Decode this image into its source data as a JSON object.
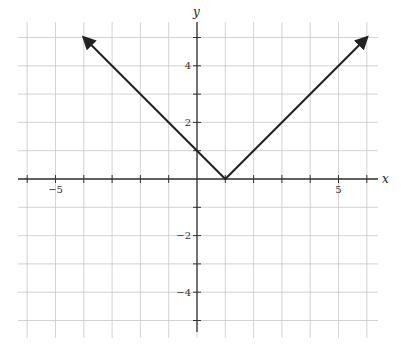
{
  "chart_data": {
    "type": "line",
    "title": "",
    "xlabel": "x",
    "ylabel": "y",
    "xlim": [
      -6.3,
      6.5
    ],
    "ylim": [
      -5.5,
      6
    ],
    "grid": true,
    "grid_step": 1,
    "x_tick_labels": [
      {
        "value": -5,
        "label": "−5"
      },
      {
        "value": 5,
        "label": "5"
      }
    ],
    "y_tick_labels": [
      {
        "value": 4,
        "label": "4"
      },
      {
        "value": 2,
        "label": "2"
      },
      {
        "value": -2,
        "label": "−2"
      },
      {
        "value": -4,
        "label": "−4"
      }
    ],
    "series": [
      {
        "name": "y = |x − 1|",
        "points": [
          [
            -4,
            5
          ],
          [
            1,
            0
          ],
          [
            6,
            5
          ]
        ],
        "arrows_at_ends": true,
        "color": "#222222"
      }
    ]
  },
  "colors": {
    "grid": "#c8c8c8",
    "axis": "#333333",
    "curve": "#222222"
  },
  "axis_labels": {
    "x": "x",
    "y": "y"
  }
}
